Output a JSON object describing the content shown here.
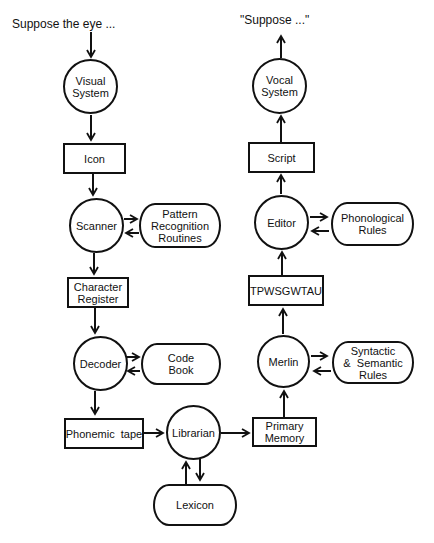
{
  "diagram": {
    "input_caption": "Suppose the eye ...",
    "output_caption": "\"Suppose ...\"",
    "nodes": {
      "visual_system": "Visual\nSystem",
      "icon": "Icon",
      "scanner": "Scanner",
      "pattern_recognition": "Pattern\nRecognition\nRoutines",
      "character_register": "Character\nRegister",
      "decoder": "Decoder",
      "code_book": "Code\nBook",
      "phonemic_tape": "Phonemic  tape",
      "librarian": "Librarian",
      "lexicon": "Lexicon",
      "primary_memory": "Primary\nMemory",
      "merlin": "Merlin",
      "syntactic_semantic": "Syntactic\n&  Semantic\nRules",
      "tpwsgwtau": "TPWSGWTAU",
      "editor": "Editor",
      "phonological_rules": "Phonological\nRules",
      "script": "Script",
      "vocal_system": "Vocal\nSystem"
    },
    "edges": [
      [
        "input",
        "visual_system"
      ],
      [
        "visual_system",
        "icon"
      ],
      [
        "icon",
        "scanner"
      ],
      [
        "scanner",
        "pattern_recognition"
      ],
      [
        "pattern_recognition",
        "scanner"
      ],
      [
        "scanner",
        "character_register"
      ],
      [
        "character_register",
        "decoder"
      ],
      [
        "decoder",
        "code_book"
      ],
      [
        "code_book",
        "decoder"
      ],
      [
        "decoder",
        "phonemic_tape"
      ],
      [
        "phonemic_tape",
        "librarian"
      ],
      [
        "librarian",
        "lexicon"
      ],
      [
        "lexicon",
        "librarian"
      ],
      [
        "librarian",
        "primary_memory"
      ],
      [
        "primary_memory",
        "merlin"
      ],
      [
        "merlin",
        "syntactic_semantic"
      ],
      [
        "syntactic_semantic",
        "merlin"
      ],
      [
        "merlin",
        "tpwsgwtau"
      ],
      [
        "tpwsgwtau",
        "editor"
      ],
      [
        "editor",
        "phonological_rules"
      ],
      [
        "phonological_rules",
        "editor"
      ],
      [
        "editor",
        "script"
      ],
      [
        "script",
        "vocal_system"
      ],
      [
        "vocal_system",
        "output"
      ]
    ],
    "line_color": "#111111",
    "background": "#ffffff"
  }
}
